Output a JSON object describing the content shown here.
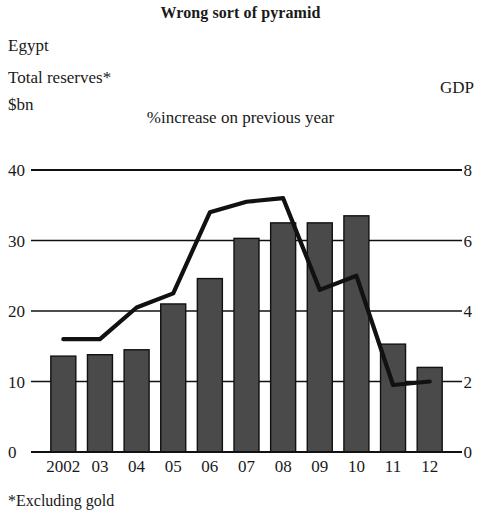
{
  "header": {
    "title": "Wrong sort of pyramid",
    "country": "Egypt",
    "left_axis_caption_line1": "Total reserves*",
    "left_axis_caption_line2": "$bn",
    "right_axis_caption": "GDP",
    "center_caption": "%increase on previous year",
    "footnote": "*Excluding gold"
  },
  "colors": {
    "bar_fill": "#4a4a4a",
    "bar_stroke": "#111111",
    "line": "#111111",
    "grid": "#111111",
    "text": "#1a1a1a",
    "background": "#ffffff"
  },
  "chart_data": {
    "type": "bar",
    "title": "Wrong sort of pyramid",
    "subtitle": "Egypt",
    "xlabel": "",
    "ylabel": "Total reserves* $bn",
    "y2label": "GDP %increase on previous year",
    "categories": [
      "2002",
      "03",
      "04",
      "05",
      "06",
      "07",
      "08",
      "09",
      "10",
      "11",
      "12"
    ],
    "ylim": [
      0,
      40
    ],
    "yticks": [
      0,
      10,
      20,
      30,
      40
    ],
    "y2lim": [
      0,
      8
    ],
    "y2ticks": [
      0,
      2,
      4,
      6,
      8
    ],
    "grid": true,
    "legend": false,
    "series": [
      {
        "name": "Total reserves*",
        "type": "bar",
        "axis": "left",
        "unit": "$bn",
        "values": [
          13.6,
          13.8,
          14.5,
          21.0,
          24.6,
          30.3,
          32.5,
          32.5,
          33.5,
          15.3,
          12.0
        ]
      },
      {
        "name": "GDP",
        "type": "line",
        "axis": "right",
        "unit": "% increase on previous year",
        "values": [
          3.2,
          3.2,
          4.1,
          4.5,
          6.8,
          7.1,
          7.2,
          4.6,
          5.0,
          1.9,
          2.0
        ]
      }
    ]
  }
}
